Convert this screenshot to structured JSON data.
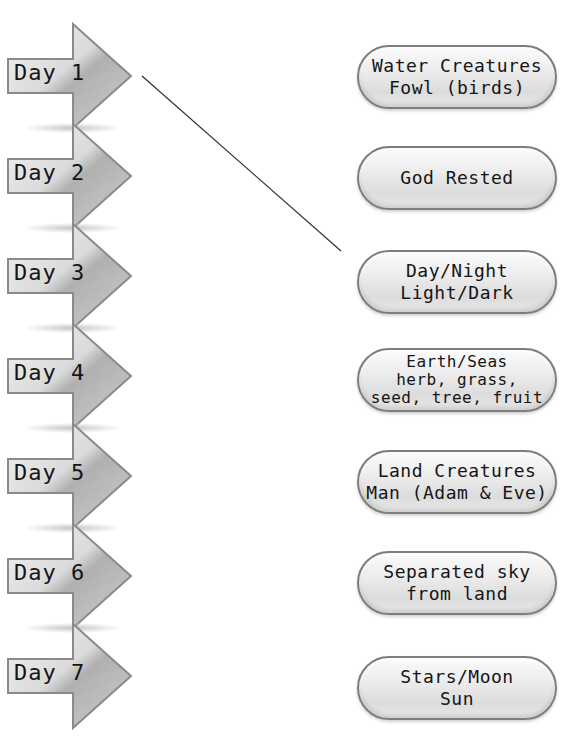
{
  "days": [
    {
      "label": "Day 1"
    },
    {
      "label": "Day 2"
    },
    {
      "label": "Day 3"
    },
    {
      "label": "Day 4"
    },
    {
      "label": "Day 5"
    },
    {
      "label": "Day 6"
    },
    {
      "label": "Day 7"
    }
  ],
  "answers": [
    {
      "lines": [
        "Water Creatures",
        "Fowl (birds)"
      ]
    },
    {
      "lines": [
        "God Rested"
      ]
    },
    {
      "lines": [
        "Day/Night",
        "Light/Dark"
      ]
    },
    {
      "lines": [
        "Earth/Seas",
        "herb, grass,",
        "seed, tree, fruit"
      ]
    },
    {
      "lines": [
        "Land Creatures",
        "Man (Adam & Eve)"
      ]
    },
    {
      "lines": [
        "Separated sky",
        "from land"
      ]
    },
    {
      "lines": [
        "Stars/Moon",
        "Sun"
      ]
    }
  ],
  "connections": [
    {
      "from_day": "Day 1",
      "to_answer": "Day/Night Light/Dark",
      "x1": 142,
      "y1": 76,
      "x2": 341,
      "y2": 251
    }
  ],
  "colors": {
    "arrow_fill_light": "#f2f2f2",
    "arrow_fill_dark": "#a9a9a9",
    "arrow_stroke": "#8a8a8a",
    "pill_border": "#7d7d7d",
    "text": "#151515",
    "line": "#333333"
  }
}
